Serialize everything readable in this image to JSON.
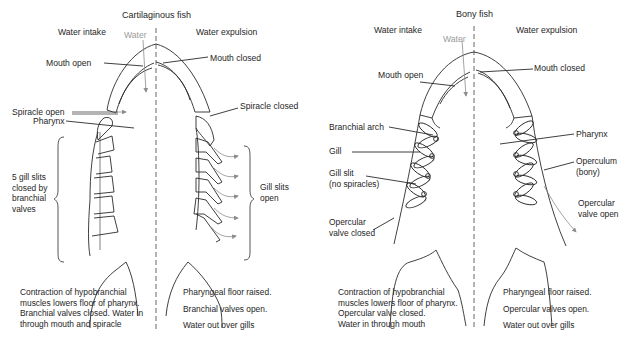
{
  "panels": [
    {
      "id": "cartilaginous",
      "title": "Cartilaginous fish",
      "intake_heading": "Water intake",
      "expulsion_heading": "Water expulsion",
      "water_label": "Water",
      "labels": {
        "mouth_open": "Mouth open",
        "mouth_closed": "Mouth closed",
        "spiracle_open": "Spiracle open",
        "spiracle_closed": "Spiracle closed",
        "pharynx": "Pharynx",
        "gill_slits_closed": [
          "5 gill slits",
          "closed by",
          "branchial",
          "valves"
        ],
        "gill_slits_open": [
          "Gill slits",
          "open"
        ]
      },
      "intake_caption": [
        "Contraction of hypobranchial",
        "muscles lowers floor of pharynx.",
        "Branchial valves closed. Water in",
        "through mouth and spiracle"
      ],
      "expulsion_caption": [
        "Pharyngeal floor raised.",
        "Branchial valves open.",
        "Water out over gills"
      ]
    },
    {
      "id": "bony",
      "title": "Bony fish",
      "intake_heading": "Water intake",
      "expulsion_heading": "Water expulsion",
      "water_label": "Water",
      "labels": {
        "mouth_open": "Mouth open",
        "mouth_closed": "Mouth closed",
        "branchial_arch": "Branchial arch",
        "gill": "Gill",
        "gill_slit": [
          "Gill slit",
          "(no spiracles)"
        ],
        "opercular_valve_closed": [
          "Opercular",
          "valve closed"
        ],
        "pharynx": "Pharynx",
        "operculum": [
          "Operculum",
          "(bony)"
        ],
        "opercular_valve_open": [
          "Opercular",
          "valve open"
        ]
      },
      "intake_caption": [
        "Contraction of hypobranchial",
        "muscles lowers floor of pharynx.",
        "Opercular valve closed.",
        "Water in through mouth"
      ],
      "expulsion_caption": [
        "Pharyngeal floor raised.",
        "Opercular valves open.",
        "Water out over gills"
      ]
    }
  ],
  "colors": {
    "line": "#2a2a2a",
    "arrow_grey": "#8c8c8c",
    "text": "#262626",
    "water_label": "#9a9a9a"
  }
}
